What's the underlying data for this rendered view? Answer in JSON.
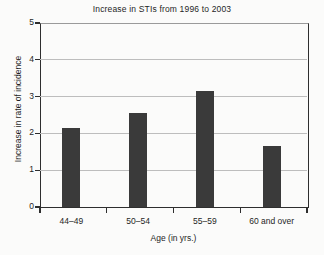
{
  "chart_data": {
    "type": "bar",
    "title": "Increase in STIs from 1996 to 2003",
    "xlabel": "Age (in yrs.)",
    "ylabel": "Increase in rate of incidence",
    "categories": [
      "44–49",
      "50–54",
      "55–59",
      "60 and over"
    ],
    "values": [
      2.15,
      2.55,
      3.15,
      1.65
    ],
    "ylim": [
      0,
      5
    ],
    "yticks": [
      "0",
      "1",
      "2",
      "3",
      "4",
      "5"
    ],
    "ytick_values": [
      0,
      1,
      2,
      3,
      4,
      5
    ],
    "grid": "horizontal",
    "legend": "none",
    "bar_color": "#3a3a3a",
    "grid_color": "#bdbdbd",
    "axis_color": "#2e2e2e",
    "background_color": "#fbfbfa"
  }
}
